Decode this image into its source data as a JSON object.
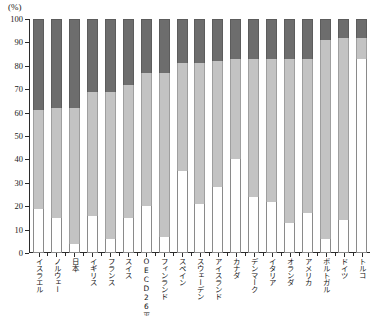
{
  "axis": {
    "unit_label": "(%)",
    "y_ticks": [
      "0",
      "10",
      "20",
      "30",
      "40",
      "50",
      "60",
      "70",
      "80",
      "90",
      "100"
    ],
    "y_min": 0,
    "y_max": 100
  },
  "chart_data": {
    "type": "bar",
    "title": "",
    "subtitle": "",
    "xlabel": "",
    "ylabel": "(%)",
    "ylim": [
      0,
      100
    ],
    "stacked": true,
    "stack_mode": "percent",
    "grid": false,
    "legend_position": "none",
    "colors": {
      "segment_bottom": "#ffffff",
      "segment_middle": "#c3c3c3",
      "segment_top": "#6d6d6d",
      "axis": "#2b2b2b"
    },
    "categories": [
      "イスラエル",
      "ノルウェー",
      "日本",
      "イギリス",
      "フランス",
      "スイス",
      "OECD26平均",
      "フィンランド",
      "スペイン",
      "スウェーデン",
      "アイスランド",
      "カナダ",
      "デンマーク",
      "イタリア",
      "オランダ",
      "アメリカ",
      "ポルトガル",
      "ドイツ",
      "トルコ"
    ],
    "series": [
      {
        "name": "下段",
        "color": "#ffffff",
        "values": [
          19,
          15,
          4,
          16,
          6,
          15,
          20,
          7,
          35,
          21,
          28,
          40,
          24,
          22,
          13,
          17,
          6,
          14,
          83
        ]
      },
      {
        "name": "中段",
        "color": "#c3c3c3",
        "values": [
          42,
          47,
          58,
          53,
          63,
          57,
          57,
          70,
          46,
          60,
          54,
          43,
          59,
          61,
          70,
          66,
          85,
          78,
          9
        ]
      },
      {
        "name": "上段",
        "color": "#6d6d6d",
        "values": [
          39,
          38,
          38,
          31,
          31,
          28,
          23,
          23,
          19,
          19,
          18,
          17,
          17,
          17,
          17,
          17,
          9,
          8,
          8
        ]
      }
    ],
    "cumulative_tops": {
      "bottom_segment_end": [
        19,
        15,
        4,
        16,
        6,
        15,
        20,
        7,
        35,
        21,
        28,
        40,
        24,
        22,
        13,
        17,
        6,
        14,
        83
      ],
      "middle_segment_end": [
        61,
        62,
        62,
        69,
        69,
        72,
        77,
        77,
        81,
        81,
        82,
        83,
        83,
        83,
        83,
        83,
        91,
        92,
        92
      ]
    }
  }
}
